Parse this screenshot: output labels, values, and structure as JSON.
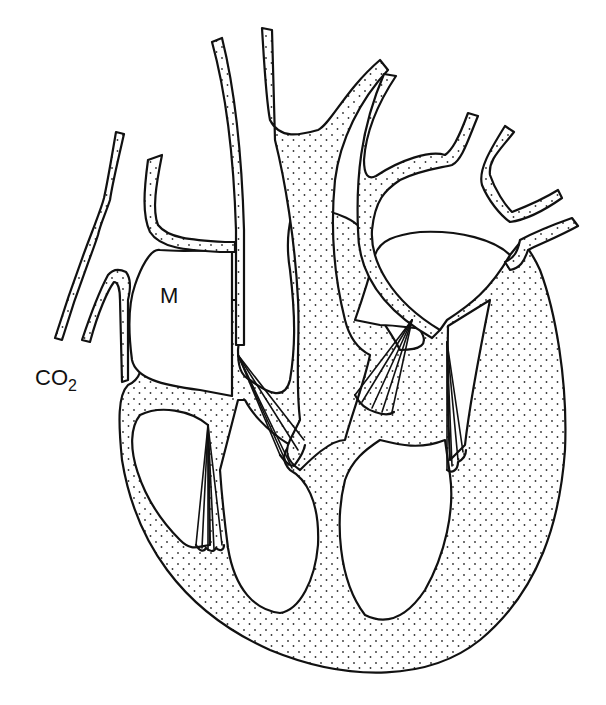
{
  "diagram": {
    "type": "anatomical line drawing",
    "labels": {
      "m": "M",
      "co2_main": "CO",
      "co2_sub": "2"
    },
    "colors": {
      "line": "#111111",
      "background": "#ffffff",
      "stipple": "#333333"
    }
  }
}
